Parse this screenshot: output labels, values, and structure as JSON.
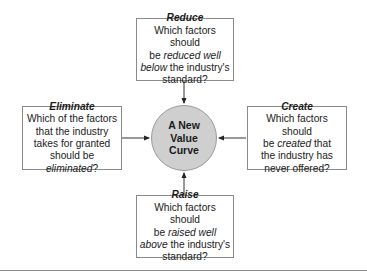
{
  "center": {
    "lines": [
      "A New",
      "Value",
      "Curve"
    ],
    "fill_color": "#cfcfcf"
  },
  "boxes": {
    "reduce": {
      "title": "Reduce",
      "lines": [
        {
          "pre": "Which factors should",
          "em": "",
          "post": ""
        },
        {
          "pre": "be ",
          "em": "reduced well",
          "post": ""
        },
        {
          "pre": "",
          "em": "below",
          "post": " the industry's"
        },
        {
          "pre": "standard?",
          "em": "",
          "post": ""
        }
      ]
    },
    "eliminate": {
      "title": "Eliminate",
      "lines": [
        {
          "pre": "Which of the factors",
          "em": "",
          "post": ""
        },
        {
          "pre": "that the industry",
          "em": "",
          "post": ""
        },
        {
          "pre": "takes for granted",
          "em": "",
          "post": ""
        },
        {
          "pre": "should be ",
          "em": "eliminated",
          "post": "?"
        }
      ]
    },
    "create": {
      "title": "Create",
      "lines": [
        {
          "pre": "Which factors should",
          "em": "",
          "post": ""
        },
        {
          "pre": "be ",
          "em": "created",
          "post": " that"
        },
        {
          "pre": "the industry has",
          "em": "",
          "post": ""
        },
        {
          "pre": "never offered?",
          "em": "",
          "post": ""
        }
      ]
    },
    "raise": {
      "title": "Raise",
      "lines": [
        {
          "pre": "Which factors should",
          "em": "",
          "post": ""
        },
        {
          "pre": "be ",
          "em": "raised well",
          "post": ""
        },
        {
          "pre": "",
          "em": "above",
          "post": " the industry's"
        },
        {
          "pre": "standard?",
          "em": "",
          "post": ""
        }
      ]
    }
  }
}
